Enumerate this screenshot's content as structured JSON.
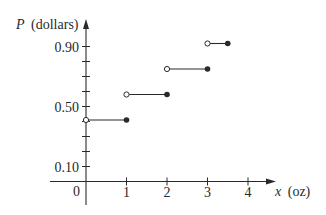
{
  "chart_data": {
    "type": "line",
    "subtype": "step-function",
    "title": "",
    "xlabel": "x (oz)",
    "ylabel": "P (dollars)",
    "xlabel_var": "x",
    "xlabel_unit": "(oz)",
    "ylabel_var": "P",
    "ylabel_unit": "(dollars)",
    "xlim": [
      0,
      4
    ],
    "ylim": [
      0,
      0.9
    ],
    "x_ticks": [
      1,
      2,
      3,
      4
    ],
    "x_tick_labels": [
      "1",
      "2",
      "3",
      "4"
    ],
    "origin_label": "0",
    "y_ticks": [
      0.1,
      0.2,
      0.3,
      0.4,
      0.5,
      0.6,
      0.7,
      0.8,
      0.9
    ],
    "y_tick_labels": [
      {
        "value": 0.1,
        "label": "0.10"
      },
      {
        "value": 0.5,
        "label": "0.50"
      },
      {
        "value": 0.9,
        "label": "0.90"
      }
    ],
    "grid": false,
    "legend": null,
    "series": [
      {
        "name": "P(x)",
        "segments": [
          {
            "x_start": 0,
            "x_end": 1,
            "y": 0.41,
            "start": "open",
            "end": "closed"
          },
          {
            "x_start": 1,
            "x_end": 2,
            "y": 0.58,
            "start": "open",
            "end": "closed"
          },
          {
            "x_start": 2,
            "x_end": 3,
            "y": 0.75,
            "start": "open",
            "end": "closed"
          },
          {
            "x_start": 3,
            "x_end": 3.5,
            "y": 0.92,
            "start": "open",
            "end": "closed"
          }
        ]
      }
    ],
    "colors": {
      "ink": "#2a2a2a",
      "background": "#ffffff"
    }
  }
}
